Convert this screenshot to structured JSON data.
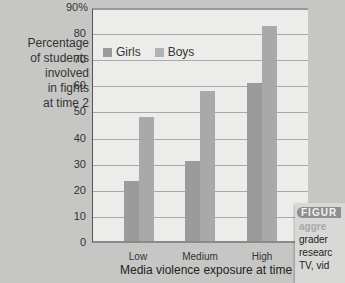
{
  "chart_data": {
    "type": "bar",
    "title": "",
    "xlabel": "Media violence exposure at time 1",
    "ylabel": "Percentage of students involved in fights at time 2",
    "ylabel_lines": [
      "Percentage",
      "of students",
      "involved",
      "in fights",
      "at time 2"
    ],
    "categories": [
      "Low",
      "Medium",
      "High"
    ],
    "series": [
      {
        "name": "Girls",
        "values": [
          23,
          31,
          61
        ],
        "color": "#9b9b9b"
      },
      {
        "name": "Boys",
        "values": [
          48,
          58,
          83
        ],
        "color": "#a9a9a9"
      }
    ],
    "ylim": [
      0,
      90
    ],
    "yticks": [
      "0",
      "10",
      "20",
      "30",
      "40",
      "50",
      "60",
      "70",
      "80",
      "90%"
    ],
    "grid": true,
    "legend_position": "top-left inside"
  },
  "caption": {
    "tag": "FIGUR",
    "lines": [
      "aggre",
      "grader",
      "researc",
      "TV, vid"
    ]
  }
}
